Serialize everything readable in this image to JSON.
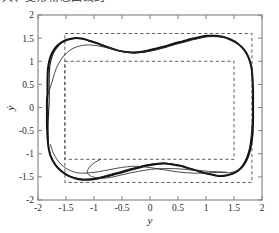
{
  "caption": {
    "clipped_top_text": "大、变形物态曲线的"
  },
  "chart_data": {
    "type": "line",
    "title": "",
    "xlabel": "y",
    "ylabel": "ẏ",
    "xlim": [
      -2,
      2
    ],
    "ylim": [
      -2,
      2
    ],
    "grid": false,
    "legend": null,
    "xticks": [
      -2,
      -1.5,
      -1,
      -0.5,
      0,
      0.5,
      1,
      1.5,
      2
    ],
    "xticklabels": [
      "-2",
      "-1.5",
      "-1",
      "-0.5",
      "0",
      "0.5",
      "1",
      "1.5",
      "2"
    ],
    "yticks": [
      -2,
      -1.5,
      -1,
      -0.5,
      0,
      0.5,
      1,
      1.5,
      2
    ],
    "yticklabels": [
      "-2",
      "-1.5",
      "-1",
      "-0.5",
      "0",
      "0.5",
      "1",
      "1.5",
      "2"
    ],
    "annotations": [
      {
        "name": "outer-dashed-rectangle",
        "type": "rect",
        "x0": -1.52,
        "y0": -1.62,
        "x1": 1.82,
        "y1": 1.6,
        "style": "dashed"
      },
      {
        "name": "inner-dashed-rectangle",
        "type": "rect",
        "x0": -1.52,
        "y0": -1.12,
        "x1": 1.5,
        "y1": 1.0,
        "style": "dashed"
      }
    ],
    "series": [
      {
        "name": "limit-cycle-outer",
        "kind": "closed-orbit",
        "linewidth": 2.0,
        "points": [
          [
            -1.83,
            0.3
          ],
          [
            -1.83,
            0.62
          ],
          [
            -1.82,
            0.86
          ],
          [
            -1.79,
            1.05
          ],
          [
            -1.74,
            1.2
          ],
          [
            -1.67,
            1.32
          ],
          [
            -1.58,
            1.41
          ],
          [
            -1.47,
            1.47
          ],
          [
            -1.35,
            1.5
          ],
          [
            -1.22,
            1.49
          ],
          [
            -1.1,
            1.45
          ],
          [
            -0.97,
            1.4
          ],
          [
            -0.84,
            1.34
          ],
          [
            -0.7,
            1.28
          ],
          [
            -0.56,
            1.23
          ],
          [
            -0.42,
            1.2
          ],
          [
            -0.3,
            1.19
          ],
          [
            -0.18,
            1.2
          ],
          [
            -0.05,
            1.23
          ],
          [
            0.1,
            1.27
          ],
          [
            0.26,
            1.32
          ],
          [
            0.42,
            1.38
          ],
          [
            0.58,
            1.43
          ],
          [
            0.73,
            1.48
          ],
          [
            0.88,
            1.52
          ],
          [
            1.02,
            1.55
          ],
          [
            1.16,
            1.55
          ],
          [
            1.3,
            1.53
          ],
          [
            1.44,
            1.47
          ],
          [
            1.57,
            1.38
          ],
          [
            1.68,
            1.25
          ],
          [
            1.76,
            1.08
          ],
          [
            1.81,
            0.88
          ],
          [
            1.83,
            0.64
          ],
          [
            1.84,
            0.36
          ],
          [
            1.84,
            0.05
          ],
          [
            1.84,
            -0.27
          ],
          [
            1.83,
            -0.58
          ],
          [
            1.8,
            -0.85
          ],
          [
            1.75,
            -1.06
          ],
          [
            1.68,
            -1.23
          ],
          [
            1.59,
            -1.35
          ],
          [
            1.48,
            -1.43
          ],
          [
            1.36,
            -1.47
          ],
          [
            1.23,
            -1.48
          ],
          [
            1.1,
            -1.45
          ],
          [
            0.96,
            -1.41
          ],
          [
            0.82,
            -1.36
          ],
          [
            0.68,
            -1.31
          ],
          [
            0.54,
            -1.26
          ],
          [
            0.4,
            -1.23
          ],
          [
            0.26,
            -1.21
          ],
          [
            0.12,
            -1.22
          ],
          [
            -0.02,
            -1.25
          ],
          [
            -0.17,
            -1.29
          ],
          [
            -0.33,
            -1.34
          ],
          [
            -0.49,
            -1.4
          ],
          [
            -0.65,
            -1.45
          ],
          [
            -0.8,
            -1.5
          ],
          [
            -0.95,
            -1.54
          ],
          [
            -1.08,
            -1.56
          ],
          [
            -1.21,
            -1.56
          ],
          [
            -1.34,
            -1.53
          ],
          [
            -1.47,
            -1.47
          ],
          [
            -1.59,
            -1.37
          ],
          [
            -1.69,
            -1.24
          ],
          [
            -1.77,
            -1.07
          ],
          [
            -1.81,
            -0.88
          ],
          [
            -1.83,
            -0.64
          ],
          [
            -1.84,
            -0.38
          ],
          [
            -1.84,
            -0.1
          ],
          [
            -1.84,
            0.14
          ],
          [
            -1.83,
            0.3
          ]
        ]
      },
      {
        "name": "limit-cycle-overlay",
        "kind": "closed-orbit",
        "linewidth": 1.15,
        "points": [
          [
            -1.8,
            0.32
          ],
          [
            -1.8,
            0.64
          ],
          [
            -1.79,
            0.88
          ],
          [
            -1.76,
            1.06
          ],
          [
            -1.71,
            1.21
          ],
          [
            -1.64,
            1.33
          ],
          [
            -1.55,
            1.42
          ],
          [
            -1.44,
            1.47
          ],
          [
            -1.32,
            1.5
          ],
          [
            -1.19,
            1.48
          ],
          [
            -1.07,
            1.44
          ],
          [
            -0.94,
            1.39
          ],
          [
            -0.81,
            1.33
          ],
          [
            -0.67,
            1.27
          ],
          [
            -0.53,
            1.22
          ],
          [
            -0.39,
            1.19
          ],
          [
            -0.27,
            1.18
          ],
          [
            -0.15,
            1.19
          ],
          [
            -0.02,
            1.22
          ],
          [
            0.13,
            1.26
          ],
          [
            0.29,
            1.31
          ],
          [
            0.45,
            1.37
          ],
          [
            0.61,
            1.42
          ],
          [
            0.76,
            1.47
          ],
          [
            0.91,
            1.51
          ],
          [
            1.05,
            1.54
          ],
          [
            1.19,
            1.54
          ],
          [
            1.33,
            1.52
          ],
          [
            1.46,
            1.45
          ],
          [
            1.59,
            1.36
          ],
          [
            1.69,
            1.23
          ],
          [
            1.77,
            1.06
          ],
          [
            1.81,
            0.87
          ],
          [
            1.83,
            0.63
          ],
          [
            1.83,
            0.35
          ],
          [
            1.83,
            0.04
          ],
          [
            1.83,
            -0.28
          ],
          [
            1.81,
            -0.59
          ],
          [
            1.78,
            -0.86
          ],
          [
            1.73,
            -1.07
          ],
          [
            1.66,
            -1.24
          ],
          [
            1.57,
            -1.36
          ],
          [
            1.46,
            -1.43
          ],
          [
            1.34,
            -1.47
          ],
          [
            1.21,
            -1.47
          ],
          [
            1.08,
            -1.44
          ],
          [
            0.94,
            -1.4
          ],
          [
            0.8,
            -1.35
          ],
          [
            0.66,
            -1.3
          ],
          [
            0.52,
            -1.25
          ],
          [
            0.38,
            -1.22
          ],
          [
            0.24,
            -1.2
          ],
          [
            0.1,
            -1.21
          ],
          [
            -0.05,
            -1.24
          ],
          [
            -0.2,
            -1.28
          ],
          [
            -0.36,
            -1.33
          ],
          [
            -0.52,
            -1.39
          ],
          [
            -0.68,
            -1.44
          ],
          [
            -0.83,
            -1.49
          ],
          [
            -0.97,
            -1.53
          ],
          [
            -1.1,
            -1.55
          ],
          [
            -1.23,
            -1.55
          ],
          [
            -1.36,
            -1.52
          ],
          [
            -1.49,
            -1.46
          ],
          [
            -1.6,
            -1.36
          ],
          [
            -1.7,
            -1.22
          ],
          [
            -1.77,
            -1.05
          ],
          [
            -1.81,
            -0.86
          ],
          [
            -1.82,
            -0.62
          ],
          [
            -1.82,
            -0.36
          ],
          [
            -1.81,
            -0.09
          ],
          [
            -1.8,
            0.15
          ],
          [
            -1.8,
            0.32
          ]
        ]
      },
      {
        "name": "transient-trajectory-upper",
        "kind": "open-trajectory",
        "linewidth": 0.85,
        "points": [
          [
            -1.82,
            0.3
          ],
          [
            -1.75,
            0.55
          ],
          [
            -1.7,
            0.76
          ],
          [
            -1.64,
            0.93
          ],
          [
            -1.57,
            1.07
          ],
          [
            -1.49,
            1.18
          ],
          [
            -1.39,
            1.27
          ],
          [
            -1.28,
            1.32
          ],
          [
            -1.16,
            1.35
          ],
          [
            -1.04,
            1.35
          ],
          [
            -0.92,
            1.33
          ],
          [
            -0.79,
            1.3
          ],
          [
            -0.66,
            1.26
          ],
          [
            -0.53,
            1.22
          ],
          [
            -0.4,
            1.19
          ],
          [
            -0.28,
            1.18
          ],
          [
            -0.16,
            1.19
          ],
          [
            -0.03,
            1.21
          ],
          [
            0.12,
            1.25
          ],
          [
            0.28,
            1.3
          ],
          [
            0.44,
            1.36
          ],
          [
            0.6,
            1.41
          ],
          [
            0.75,
            1.46
          ],
          [
            0.9,
            1.5
          ],
          [
            1.04,
            1.53
          ],
          [
            1.18,
            1.53
          ],
          [
            1.32,
            1.51
          ],
          [
            1.45,
            1.45
          ]
        ]
      },
      {
        "name": "transient-trajectory-lower-a",
        "kind": "open-trajectory",
        "linewidth": 0.85,
        "points": [
          [
            -1.78,
            -0.8
          ],
          [
            -1.72,
            -1.0
          ],
          [
            -1.64,
            -1.16
          ],
          [
            -1.54,
            -1.28
          ],
          [
            -1.43,
            -1.36
          ],
          [
            -1.31,
            -1.41
          ],
          [
            -1.18,
            -1.42
          ],
          [
            -1.05,
            -1.41
          ],
          [
            -0.92,
            -1.39
          ],
          [
            -0.79,
            -1.36
          ],
          [
            -0.66,
            -1.33
          ],
          [
            -0.53,
            -1.3
          ],
          [
            -0.4,
            -1.28
          ],
          [
            -0.27,
            -1.27
          ],
          [
            -0.13,
            -1.28
          ],
          [
            0.01,
            -1.3
          ],
          [
            0.16,
            -1.33
          ],
          [
            0.32,
            -1.36
          ],
          [
            0.48,
            -1.39
          ],
          [
            0.64,
            -1.41
          ],
          [
            0.8,
            -1.42
          ],
          [
            0.96,
            -1.42
          ],
          [
            1.12,
            -1.41
          ],
          [
            1.27,
            -1.4
          ],
          [
            1.42,
            -1.41
          ],
          [
            1.56,
            -1.36
          ],
          [
            1.66,
            -1.25
          ]
        ]
      },
      {
        "name": "transient-trajectory-lower-b",
        "kind": "open-trajectory",
        "linewidth": 0.85,
        "points": [
          [
            -0.88,
            -1.12
          ],
          [
            -1.0,
            -1.2
          ],
          [
            -1.08,
            -1.29
          ],
          [
            -1.12,
            -1.38
          ],
          [
            -1.1,
            -1.45
          ],
          [
            -1.02,
            -1.5
          ],
          [
            -0.9,
            -1.53
          ],
          [
            -0.76,
            -1.52
          ],
          [
            -0.62,
            -1.49
          ],
          [
            -0.48,
            -1.45
          ],
          [
            -0.34,
            -1.41
          ],
          [
            -0.2,
            -1.38
          ],
          [
            -0.06,
            -1.35
          ],
          [
            0.08,
            -1.33
          ],
          [
            0.24,
            -1.32
          ],
          [
            0.4,
            -1.32
          ],
          [
            0.56,
            -1.33
          ],
          [
            0.72,
            -1.35
          ],
          [
            0.88,
            -1.36
          ],
          [
            1.04,
            -1.38
          ],
          [
            1.2,
            -1.39
          ],
          [
            1.36,
            -1.4
          ]
        ]
      }
    ]
  }
}
